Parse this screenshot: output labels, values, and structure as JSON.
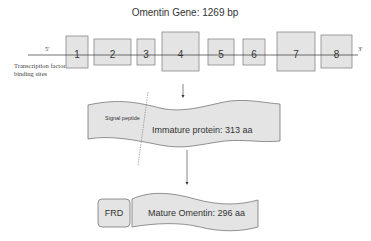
{
  "title": "Omentin Gene: 1269 bp",
  "gene": {
    "five_prime": "5'",
    "three_prime": "3'",
    "tf_label_line1": "Transcription factor",
    "tf_label_line2": "binding sites",
    "exons": [
      "1",
      "2",
      "3",
      "4",
      "5",
      "6",
      "7",
      "8"
    ]
  },
  "immature_protein": {
    "signal_peptide": "Signal peptide",
    "label": "Immature protein: 313 aa"
  },
  "mature_protein": {
    "domain": "FRD",
    "label": "Mature Omentin: 296 aa"
  },
  "colors": {
    "box_fill": "#e4e4e4",
    "box_stroke": "#888888",
    "line": "#333333"
  }
}
